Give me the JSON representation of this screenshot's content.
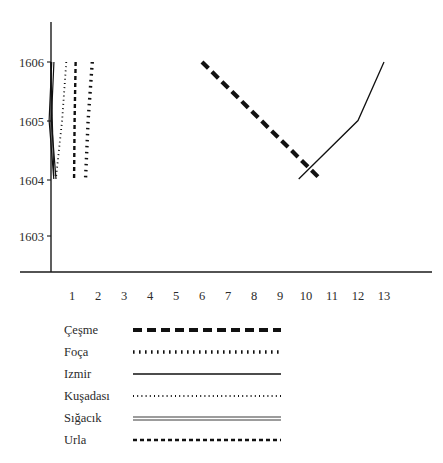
{
  "chart_data": {
    "type": "line",
    "title": "",
    "subtitle": "",
    "xlabel": "",
    "ylabel": "",
    "xlim": [
      0,
      13.6
    ],
    "ylim": [
      1602.55,
      1606.4
    ],
    "grid": false,
    "legend_position": "bottom-left",
    "x_ticks": [
      "1",
      "2",
      "3",
      "4",
      "5",
      "6",
      "7",
      "8",
      "9",
      "10",
      "11",
      "12",
      "13"
    ],
    "x_tick_values": [
      1,
      2,
      3,
      4,
      5,
      6,
      7,
      8,
      9,
      10,
      11,
      12,
      13
    ],
    "y_ticks": [
      "1606",
      "1605",
      "1604",
      "1603"
    ],
    "y_tick_values": [
      1606,
      1605,
      1604,
      1603
    ],
    "series": [
      {
        "name": "Çeşme",
        "style": "thick-dashed",
        "dash": "9,5",
        "width": 4.2,
        "color": "#111111",
        "points": [
          [
            6.0,
            1606.0
          ],
          [
            10.55,
            1604.0
          ]
        ]
      },
      {
        "name": "Foça",
        "style": "thick-dotted",
        "dash": "1.6,4.4",
        "width": 3.4,
        "color": "#111111",
        "points": [
          [
            1.78,
            1606.0
          ],
          [
            1.62,
            1605.0
          ],
          [
            1.52,
            1604.0
          ]
        ]
      },
      {
        "name": "Izmir",
        "style": "solid",
        "dash": "none",
        "width": 1.3,
        "color": "#111111",
        "points": [
          [
            9.72,
            1604.0
          ],
          [
            12.0,
            1605.0
          ],
          [
            13.0,
            1606.0
          ]
        ]
      },
      {
        "name": "Kuşadası",
        "style": "fine-dotted",
        "dash": "1,3.2",
        "width": 1.8,
        "color": "#111111",
        "points": [
          [
            0.78,
            1606.0
          ],
          [
            0.62,
            1605.0
          ],
          [
            0.38,
            1604.0
          ]
        ]
      },
      {
        "name": "Sığacık",
        "style": "double-solid",
        "dash": "none",
        "width": 1.2,
        "color": "#3a3a3a",
        "points": [
          [
            0.22,
            1606.0
          ],
          [
            0.12,
            1605.0
          ],
          [
            0.3,
            1604.0
          ]
        ]
      },
      {
        "name": "Urla",
        "style": "fine-dashed",
        "dash": "4,3",
        "width": 2.4,
        "color": "#111111",
        "points": [
          [
            1.14,
            1606.0
          ],
          [
            1.1,
            1605.0
          ],
          [
            1.08,
            1604.0
          ]
        ]
      }
    ],
    "extra_series": [
      {
        "name": "Izmir-left",
        "style": "solid",
        "width": 1.2,
        "color": "#111111",
        "points": [
          [
            0.18,
            1606.0
          ],
          [
            0.3,
            1604.05
          ]
        ]
      }
    ]
  },
  "legend": {
    "items": [
      {
        "label": "Çeşme",
        "sample": "thick-dashed"
      },
      {
        "label": "Foça",
        "sample": "thick-dotted"
      },
      {
        "label": "Izmir",
        "sample": "solid"
      },
      {
        "label": "Kuşadası",
        "sample": "fine-dotted"
      },
      {
        "label": "Sığacık",
        "sample": "double-solid"
      },
      {
        "label": "Urla",
        "sample": "fine-dashed"
      }
    ]
  },
  "axes": {
    "y_labels": [
      "1606",
      "1605",
      "1604",
      "1603"
    ],
    "x_labels": [
      "1",
      "2",
      "3",
      "4",
      "5",
      "6",
      "7",
      "8",
      "9",
      "10",
      "11",
      "12",
      "13"
    ]
  }
}
